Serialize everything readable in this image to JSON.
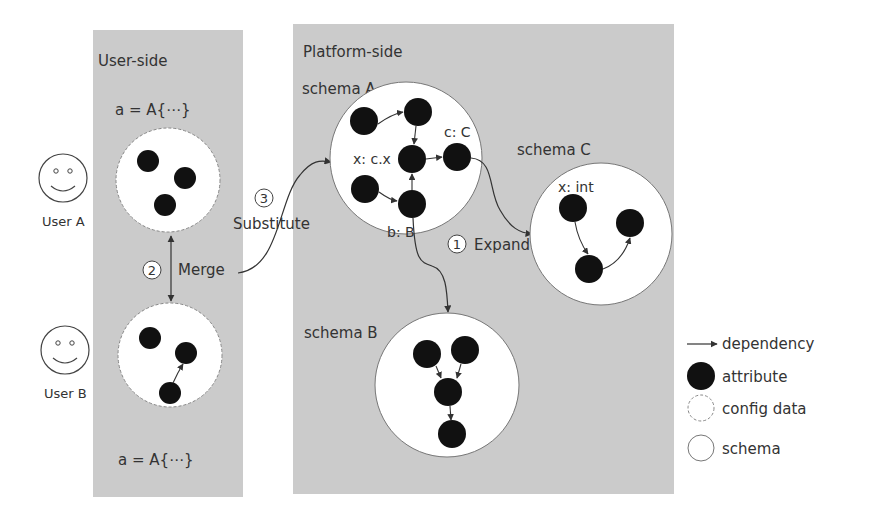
{
  "panels": {
    "user_side": {
      "title": "User-side",
      "color": "#cbcbcb"
    },
    "platform_side": {
      "title": "Platform-side",
      "color": "#cbcbcb"
    }
  },
  "users": [
    {
      "label": "User A",
      "config_label": "a = A{⋯}"
    },
    {
      "label": "User B",
      "config_label": "a = A{⋯}"
    }
  ],
  "steps": [
    {
      "number": "1",
      "label": "Expand"
    },
    {
      "number": "2",
      "label": "Merge"
    },
    {
      "number": "3",
      "label": "Substitute"
    }
  ],
  "schemas": {
    "a": {
      "title": "schema A",
      "attr_labels": {
        "x": "x: c.x",
        "c": "c: C",
        "b": "b: B"
      }
    },
    "b": {
      "title": "schema B"
    },
    "c": {
      "title": "schema C",
      "attr_labels": {
        "x": "x: int"
      }
    }
  },
  "legend": [
    {
      "icon": "arrow-icon",
      "label": "dependency"
    },
    {
      "icon": "filled-circle-icon",
      "label": "attribute"
    },
    {
      "icon": "dashed-circle-icon",
      "label": "config data"
    },
    {
      "icon": "outline-circle-icon",
      "label": "schema"
    }
  ],
  "colors": {
    "attribute": "#111111",
    "line": "#333333",
    "panel": "#cbcbcb",
    "circle_fill": "#ffffff"
  }
}
